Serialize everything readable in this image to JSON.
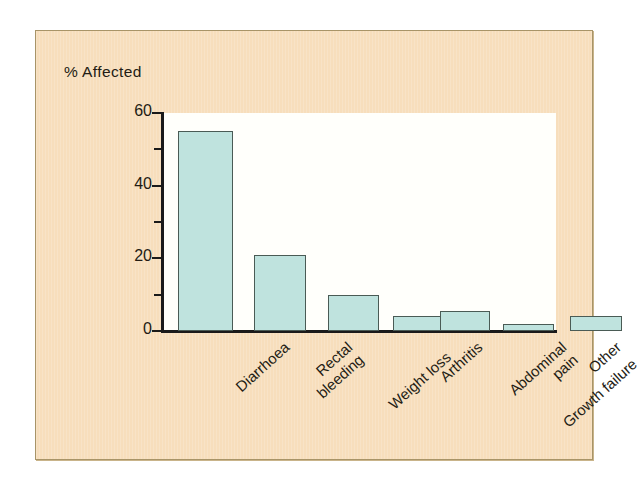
{
  "figure": {
    "background_color": "#f7debc",
    "plot_background_color": "#fffffb",
    "border_color": "#a89468",
    "bar_fill_color": "#bfe3de",
    "bar_edge_color": "#4a5b55",
    "axis_color": "#1a1a1a",
    "text_color": "#231c14"
  },
  "chart_data": {
    "type": "bar",
    "title": "",
    "subtitle": "",
    "xlabel": "",
    "ylabel": "% Affected",
    "ylim": [
      0,
      60
    ],
    "yticks": [
      0,
      20,
      40,
      60
    ],
    "ytick_labels": [
      "0",
      "20",
      "40",
      "60"
    ],
    "yminor_ticks": [
      10,
      30,
      50
    ],
    "grid": false,
    "legend": null,
    "categories": [
      "Diarrhoea",
      "Rectal\nbleeding",
      "Weight loss",
      "Arthritis",
      "Abdominal\npain",
      "Growth failure",
      "Other"
    ],
    "category_lines": [
      [
        "Diarrhoea"
      ],
      [
        "Rectal",
        "bleeding"
      ],
      [
        "Weight loss"
      ],
      [
        "Arthritis"
      ],
      [
        "Abdominal",
        "pain"
      ],
      [
        "Growth failure"
      ],
      [
        "Other"
      ]
    ],
    "values": [
      55,
      21,
      10,
      4,
      5.5,
      2,
      4
    ],
    "annotations": []
  }
}
